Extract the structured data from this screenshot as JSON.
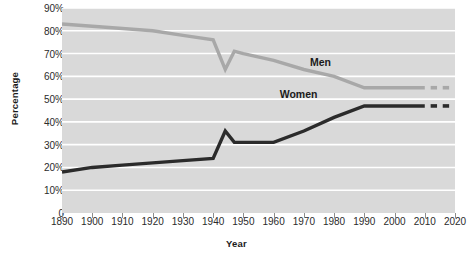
{
  "chart_data": {
    "type": "line",
    "title": "",
    "xlabel": "Year",
    "ylabel": "Percentage",
    "xlim": [
      1890,
      2020
    ],
    "ylim": [
      0,
      90
    ],
    "grid": true,
    "legend_position": "inline",
    "x_ticks": [
      "1890",
      "1900",
      "1910",
      "1920",
      "1930",
      "1940",
      "1950",
      "1960",
      "1970",
      "1980",
      "1990",
      "2000",
      "2010",
      "2020"
    ],
    "y_ticks": [
      "0",
      "10%",
      "20%",
      "30%",
      "40%",
      "50%",
      "60%",
      "70%",
      "80%",
      "90%"
    ],
    "series": [
      {
        "name": "Men",
        "color": "#a8a8a8",
        "label": "Men",
        "x": [
          1890,
          1900,
          1920,
          1930,
          1940,
          1944,
          1947,
          1950,
          1960,
          1970,
          1980,
          1990,
          2000,
          2010
        ],
        "values": [
          83,
          82,
          80,
          78,
          76,
          63,
          71,
          70,
          67,
          63,
          60,
          55,
          55,
          55
        ],
        "projected_x": [
          2013,
          2017
        ],
        "projected_values": [
          55,
          55
        ]
      },
      {
        "name": "Women",
        "color": "#2b2b2b",
        "label": "Women",
        "x": [
          1890,
          1900,
          1910,
          1920,
          1930,
          1940,
          1944,
          1947,
          1950,
          1960,
          1970,
          1980,
          1990,
          2000,
          2010
        ],
        "values": [
          18,
          20,
          21,
          22,
          23,
          24,
          36,
          31,
          31,
          31,
          36,
          42,
          47,
          47,
          47
        ],
        "projected_x": [
          2013,
          2017
        ],
        "projected_values": [
          47,
          47
        ]
      }
    ],
    "annotations": [
      {
        "text": "Men",
        "x": 1972,
        "y": 66
      },
      {
        "text": "Women",
        "x": 1962,
        "y": 52
      }
    ]
  },
  "style": {
    "plot_background": "#d9d9d9",
    "grid_color": "#ffffff",
    "axis_color": "#8c8c8c",
    "page_background": "#ffffff",
    "men_color": "#a8a8a8",
    "women_color": "#2b2b2b"
  }
}
